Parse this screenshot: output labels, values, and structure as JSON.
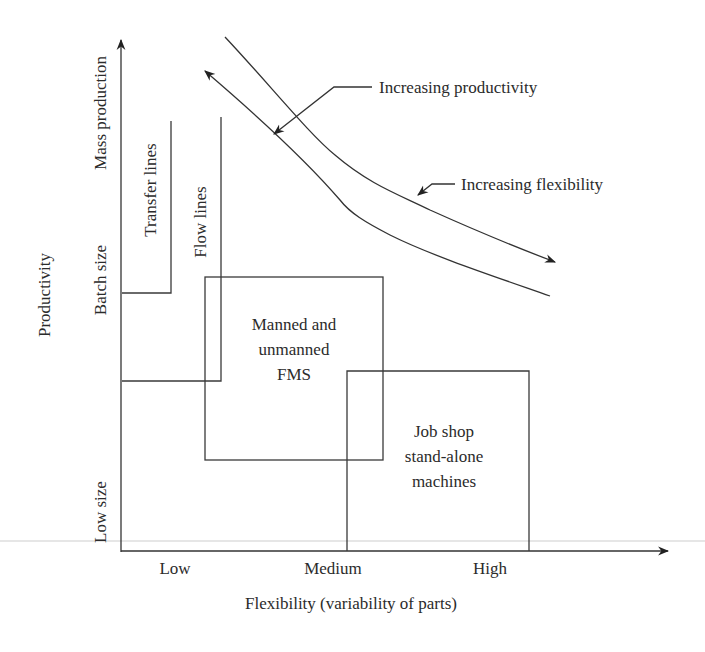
{
  "axes": {
    "x": {
      "label": "Flexibility (variability of parts)",
      "ticks": [
        "Low",
        "Medium",
        "High"
      ]
    },
    "y": {
      "label": "Productivity",
      "ticks": [
        "Low size",
        "Batch size",
        "Mass production"
      ]
    }
  },
  "regions": {
    "transfer_lines": "Transfer lines",
    "flow_lines": "Flow lines",
    "fms": [
      "Manned and",
      "unmanned",
      "FMS"
    ],
    "job_shop": [
      "Job shop",
      "stand-alone",
      "machines"
    ]
  },
  "annotations": {
    "increasing_productivity": "Increasing productivity",
    "increasing_flexibility": "Increasing flexibility"
  },
  "colors": {
    "line": "#333333",
    "text": "#2b2b2b",
    "background": "#ffffff"
  }
}
